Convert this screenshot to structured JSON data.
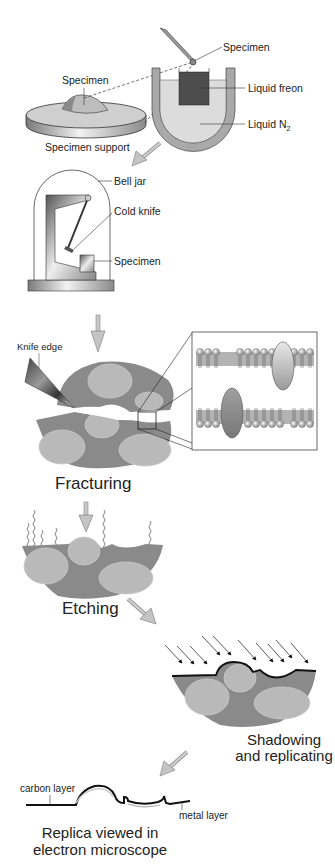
{
  "colors": {
    "tissue_dark": "#8a8a8a",
    "cell_light": "#b9b9b9",
    "freon": "#4a4a4a",
    "liquid_n2": "#d9d9d9",
    "dewar": "#a8a8a8",
    "arrow": "#b8b8b8",
    "metal_layer": "#111111"
  },
  "step1": {
    "labels": {
      "specimen_top": "Specimen",
      "specimen_support_specimen": "Specimen",
      "liquid_freon": "Liquid freon",
      "liquid_n2": "Liquid N",
      "liquid_n2_sub": "2",
      "specimen_support": "Specimen support"
    }
  },
  "step2": {
    "labels": {
      "bell_jar": "Bell jar",
      "cold_knife": "Cold knife",
      "specimen": "Specimen"
    }
  },
  "step3": {
    "labels": {
      "knife_edge": "Knife edge"
    },
    "caption": "Fracturing"
  },
  "step4": {
    "caption": "Etching"
  },
  "step5": {
    "caption_line1": "Shadowing",
    "caption_line2": "and replicating"
  },
  "step6": {
    "labels": {
      "carbon_layer": "carbon layer",
      "metal_layer": "metal layer"
    },
    "caption_line1": "Replica viewed in",
    "caption_line2": "electron microscope"
  }
}
